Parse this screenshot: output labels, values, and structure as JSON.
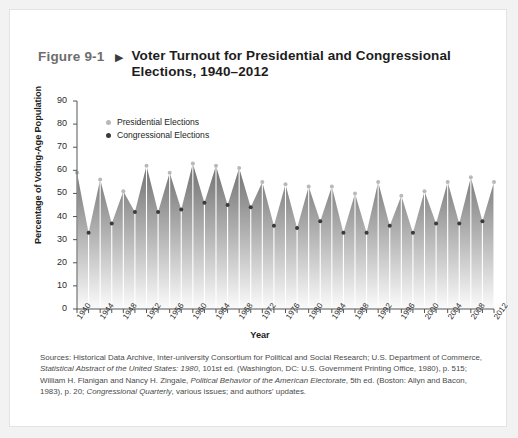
{
  "figure": {
    "number": "Figure 9-1",
    "arrow": "▶",
    "title": "Voter Turnout for Presidential and Congressional Elections, 1940–2012"
  },
  "sources": {
    "text_parts": [
      "Sources: Historical Data Archive, Inter-university Consortium for Political and Social Research; U.S. Department of Commerce, ",
      "Statistical Abstract of the United States: 1980",
      ", 101st ed. (Washington, DC: U.S. Government Printing Office, 1980), p. 515; William H. Flanigan and Nancy H. Zingale, ",
      "Political Behavior of the American Electorate",
      ", 5th ed. (Boston: Allyn and Bacon, 1983), p. 20; ",
      "Congressional Quarterly",
      ", various issues; and authors' updates."
    ]
  },
  "colors": {
    "presidential": "#b9b9b9",
    "congressional": "#3a3a3a",
    "area_top": "#6f6f6f",
    "area_bottom": "#fbfbfb",
    "axis": "#555555",
    "card_border": "#e3e3e3"
  },
  "chart_data": {
    "type": "area",
    "title": "Voter Turnout for Presidential and Congressional Elections, 1940–2012",
    "xlabel": "Year",
    "ylabel": "Percentage of Voting-Age Population",
    "ylim": [
      0,
      90
    ],
    "ytick_step": 10,
    "yticks": [
      0,
      10,
      20,
      30,
      40,
      50,
      60,
      70,
      80,
      90
    ],
    "xlim": [
      1940,
      2012
    ],
    "xtick_step": 2,
    "xlabel_step": 4,
    "xticks": [
      1940,
      1942,
      1944,
      1946,
      1948,
      1950,
      1952,
      1954,
      1956,
      1958,
      1960,
      1962,
      1964,
      1966,
      1968,
      1970,
      1972,
      1974,
      1976,
      1978,
      1980,
      1982,
      1984,
      1986,
      1988,
      1990,
      1992,
      1994,
      1996,
      1998,
      2000,
      2002,
      2004,
      2006,
      2008,
      2010,
      2012
    ],
    "xtick_labels": [
      1940,
      1944,
      1948,
      1952,
      1956,
      1960,
      1964,
      1968,
      1972,
      1976,
      1980,
      1984,
      1988,
      1992,
      1996,
      2000,
      2004,
      2008,
      2012
    ],
    "grid": false,
    "legend_position": "top-left",
    "legend": [
      "Presidential Elections",
      "Congressional Elections"
    ],
    "series": [
      {
        "name": "Presidential Elections",
        "x": [
          1940,
          1944,
          1948,
          1952,
          1956,
          1960,
          1964,
          1968,
          1972,
          1976,
          1980,
          1984,
          1988,
          1992,
          1996,
          2000,
          2004,
          2008,
          2012
        ],
        "values": [
          59,
          56,
          51,
          62,
          59,
          63,
          62,
          61,
          55,
          54,
          53,
          53,
          50,
          55,
          49,
          51,
          55,
          57,
          55
        ]
      },
      {
        "name": "Congressional Elections",
        "x": [
          1942,
          1946,
          1950,
          1954,
          1958,
          1962,
          1966,
          1970,
          1974,
          1978,
          1982,
          1986,
          1990,
          1994,
          1998,
          2002,
          2006,
          2010
        ],
        "values": [
          33,
          37,
          42,
          42,
          43,
          46,
          45,
          44,
          36,
          35,
          38,
          33,
          33,
          36,
          33,
          37,
          37,
          38
        ]
      }
    ]
  }
}
